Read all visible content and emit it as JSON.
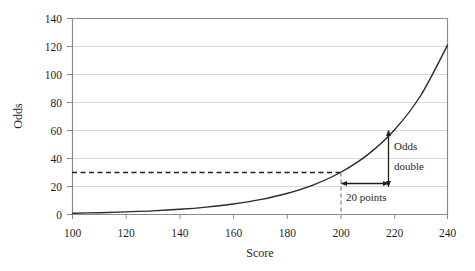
{
  "chart_data": {
    "type": "line",
    "title": "",
    "xlabel": "Score",
    "ylabel": "Odds",
    "xlim": [
      100,
      240
    ],
    "ylim": [
      0,
      140
    ],
    "xticks": [
      100,
      120,
      140,
      160,
      180,
      200,
      220,
      240
    ],
    "yticks": [
      0,
      20,
      40,
      60,
      80,
      100,
      120,
      140
    ],
    "grid": "horizontal",
    "legend": "none",
    "series": [
      {
        "name": "Odds",
        "x": [
          100,
          110,
          120,
          130,
          140,
          150,
          160,
          170,
          180,
          190,
          200,
          210,
          220,
          230,
          240
        ],
        "values": [
          0.9,
          1.3,
          1.9,
          2.6,
          3.7,
          5.3,
          7.5,
          10.6,
          15,
          21.2,
          30,
          42.4,
          60,
          85,
          121
        ]
      }
    ],
    "annotations": [
      {
        "name": "odds-double-label",
        "text_lines": [
          "Odds",
          "double"
        ],
        "x": 222,
        "y_range": [
          30,
          60
        ]
      },
      {
        "name": "twenty-points-label",
        "text": "20 points",
        "x_range": [
          200,
          220
        ],
        "y": 26
      },
      {
        "name": "reference-odds-dashed-line",
        "y": 30,
        "from_x": 100,
        "to_x": 200
      },
      {
        "name": "reference-score-dashed-line",
        "x": 200,
        "from_y": 0,
        "to_y": 30
      }
    ],
    "colors": {
      "curve": "#2b2b2b",
      "grid": "#d9d9d9",
      "axis": "#808080",
      "text": "#1f1f1f",
      "annotation": "#1f1f1f",
      "background": "#ffffff"
    }
  }
}
